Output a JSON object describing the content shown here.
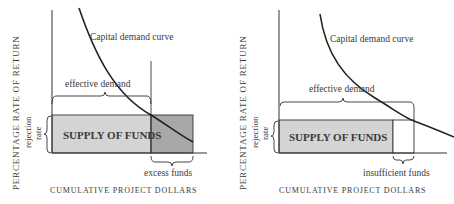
{
  "colors": {
    "axis": "#333333",
    "supply_fill": "#d4d4d4",
    "excess_fill": "#a8a8a8",
    "insufficient_fill": "#ffffff",
    "curve": "#222222"
  },
  "left": {
    "ylabel": "PERCENTAGE RATE OF RETURN",
    "rejection_label_1": "rejection",
    "rejection_label_2": "rate",
    "curve_label": "Capital demand curve",
    "effective_demand": "effective demand",
    "supply_label": "SUPPLY OF FUNDS",
    "gap_label": "excess funds",
    "xlabel": "CUMULATIVE PROJECT DOLLARS"
  },
  "right": {
    "ylabel": "PERCENTAGE RATE OF RETURN",
    "rejection_label_1": "rejection",
    "rejection_label_2": "rate",
    "curve_label": "Capital demand curve",
    "effective_demand": "effective demand",
    "supply_label": "SUPPLY OF FUNDS",
    "gap_label": "insufficient funds",
    "xlabel": "CUMULATIVE PROJECT DOLLARS"
  }
}
